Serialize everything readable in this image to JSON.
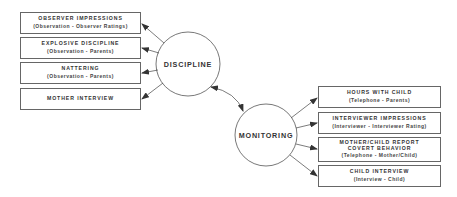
{
  "diagram": {
    "constructs": {
      "discipline": {
        "label": "DISCIPLINE"
      },
      "monitoring": {
        "label": "MONITORING"
      }
    },
    "discipline_indicators": [
      {
        "title": "OBSERVER IMPRESSIONS",
        "source": "(Observation - Observer Ratings)"
      },
      {
        "title": "EXPLOSIVE DISCIPLINE",
        "source": "(Observation - Parents)"
      },
      {
        "title": "NATTERING",
        "source": "(Observation - Parents)"
      },
      {
        "title": "MOTHER INTERVIEW",
        "source": ""
      }
    ],
    "monitoring_indicators": [
      {
        "title": "HOURS WITH CHILD",
        "source": "(Telephone - Parents)"
      },
      {
        "title": "INTERVIEWER IMPRESSIONS",
        "source": "(Interviewer - Interviewer Rating)"
      },
      {
        "title": "MOTHER/CHILD REPORT",
        "title2": "COVERT BEHAVIOR",
        "source": "(Telephone - Mother/Child)"
      },
      {
        "title": "CHILD INTERVIEW",
        "source": "(Interview - Child)"
      }
    ],
    "colors": {
      "line": "#555555",
      "border": "#666666",
      "text": "#333333",
      "background": "#ffffff"
    }
  }
}
